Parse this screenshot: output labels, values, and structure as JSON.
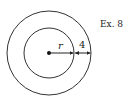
{
  "figure": {
    "label": "Ex. 8",
    "radius_label": "r",
    "gap_label": "4",
    "center": {
      "x": 49,
      "y": 53
    },
    "inner_radius": 25,
    "outer_radius": 42,
    "stroke_color": "#333333"
  }
}
